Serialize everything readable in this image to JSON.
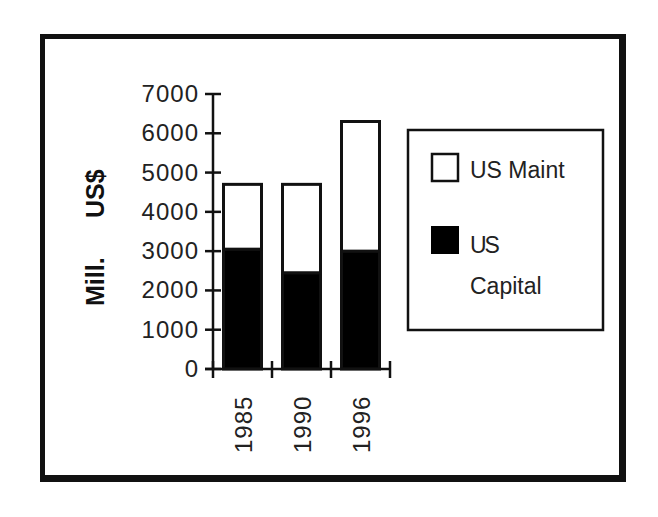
{
  "chart_data": {
    "type": "bar",
    "stacked": true,
    "title": "",
    "xlabel": "",
    "ylabel": "Mill.   US$",
    "ylim": [
      0,
      7000
    ],
    "yticks": [
      0,
      1000,
      2000,
      3000,
      4000,
      5000,
      6000,
      7000
    ],
    "ytick_labels": [
      "0",
      "1000",
      "2000",
      "3000",
      "4000",
      "5000",
      "6000",
      "7000"
    ],
    "categories": [
      "1985",
      "1990",
      "1996"
    ],
    "series": [
      {
        "name": "US Capital",
        "color": "#000000",
        "values": [
          3050,
          2450,
          3000
        ]
      },
      {
        "name": "US Maint",
        "color": "#ffffff",
        "values": [
          1650,
          2250,
          3300
        ]
      }
    ],
    "totals": [
      4700,
      4700,
      6300
    ],
    "grid": false,
    "legend_position": "right",
    "legend": [
      {
        "label": "US Maint",
        "swatch": "white"
      },
      {
        "label": "US Capital",
        "label_lines": [
          "US",
          "Capital"
        ],
        "swatch": "black"
      }
    ]
  },
  "axis": {
    "ylabel_part1": "Mill.",
    "ylabel_part2": "US$"
  }
}
